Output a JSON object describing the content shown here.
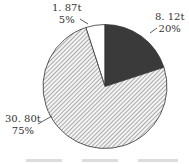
{
  "chart_data": {
    "type": "pie",
    "title": "",
    "start_angle_deg": -18,
    "direction": "clockwise",
    "slices": [
      {
        "label": "",
        "value_text": "1.87t",
        "value": 1.87,
        "percent_text": "5%",
        "percent": 5,
        "fill": "white"
      },
      {
        "label": "",
        "value_text": "8.12t",
        "value": 8.12,
        "percent_text": "20%",
        "percent": 20,
        "fill": "dark"
      },
      {
        "label": "",
        "value_text": "30.80t",
        "value": 30.8,
        "percent_text": "75%",
        "percent": 75,
        "fill": "hatched"
      }
    ],
    "colors": {
      "dark": "#3a3a3a",
      "white": "#ffffff",
      "hatch_line": "#7a7a7a",
      "hatch_bg": "#f4f4f4",
      "outline": "#333333"
    },
    "legend": {
      "position": "bottom",
      "visible": "cut off"
    }
  },
  "labels": {
    "white": {
      "value": "1. 87t",
      "pct": "5%"
    },
    "dark": {
      "value": "8. 12t",
      "pct": "20%"
    },
    "hatched": {
      "value": "30. 80t",
      "pct": "75%"
    }
  }
}
